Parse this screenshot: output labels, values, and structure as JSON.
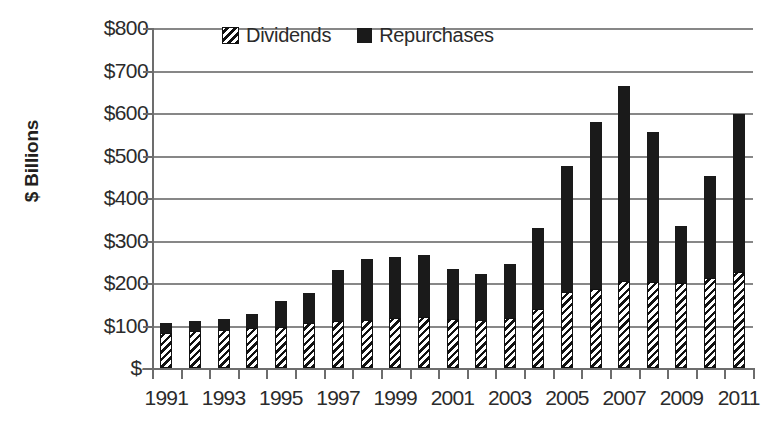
{
  "chart_data": {
    "type": "bar",
    "subtype": "stacked-column",
    "title": "",
    "xlabel": "",
    "ylabel": "$ Billions",
    "ylim": [
      0,
      800
    ],
    "ytick_values": [
      0,
      100,
      200,
      300,
      400,
      500,
      600,
      700,
      800
    ],
    "ytick_labels": [
      "$-",
      "$100",
      "$200",
      "$300",
      "$400",
      "$500",
      "$600",
      "$700",
      "$800"
    ],
    "grid": true,
    "legend_position": "top-center",
    "categories": [
      "1991",
      "1992",
      "1993",
      "1994",
      "1995",
      "1996",
      "1997",
      "1998",
      "1999",
      "2000",
      "2001",
      "2002",
      "2003",
      "2004",
      "2005",
      "2006",
      "2007",
      "2008",
      "2009",
      "2010",
      "2011"
    ],
    "xtick_labels": [
      "1991",
      "1993",
      "1995",
      "1997",
      "1999",
      "2001",
      "2003",
      "2005",
      "2007",
      "2009",
      "2011"
    ],
    "series": [
      {
        "name": "Dividends",
        "pattern": "diagonal-hatch",
        "color": "#111111",
        "values": [
          83,
          86,
          89,
          93,
          97,
          105,
          110,
          113,
          117,
          120,
          115,
          112,
          118,
          140,
          180,
          185,
          205,
          203,
          200,
          212,
          225
        ]
      },
      {
        "name": "Repurchases",
        "pattern": "solid",
        "color": "#1a1a1a",
        "values": [
          24,
          25,
          27,
          33,
          60,
          72,
          120,
          144,
          144,
          146,
          118,
          110,
          127,
          190,
          296,
          393,
          458,
          353,
          135,
          239,
          372
        ]
      }
    ],
    "totals": [
      107,
      111,
      116,
      126,
      157,
      177,
      230,
      257,
      261,
      266,
      233,
      222,
      245,
      330,
      476,
      578,
      663,
      556,
      335,
      451,
      597
    ]
  },
  "legend": {
    "items": [
      {
        "label": "Dividends",
        "swatch": "hatch-swatch-icon"
      },
      {
        "label": "Repurchases",
        "swatch": "solid-swatch-icon"
      }
    ]
  },
  "axes": {
    "y_title": "$ Billions"
  },
  "colors": {
    "repurchases": "#1a1a1a",
    "dividends_hatch": "#111111",
    "grid": "#878787",
    "axis": "#6d6d6d",
    "text": "#2b2b2b",
    "background": "#ffffff"
  }
}
